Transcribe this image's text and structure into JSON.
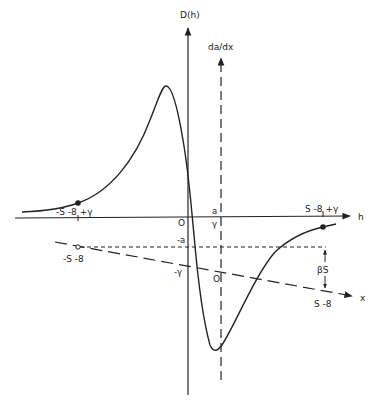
{
  "diagram": {
    "axes": {
      "vertical_main_label": "D(h)",
      "vertical_dashed_label": "da/dx",
      "horizontal_h_label": "h",
      "diagonal_x_label": "x"
    },
    "labels": {
      "left_upper_point": "-S -8 +γ",
      "left_lower_point": "-S -8",
      "origin_main": "O",
      "origin_dashed": "O",
      "a_label": "a",
      "gamma_label": "γ",
      "minus_a_label": "-a",
      "minus_gamma_label": "-γ",
      "right_upper_point": "S -8 +γ",
      "right_lower_point": "S -8",
      "beta_s": "βS"
    },
    "colors": {
      "ink": "#222222",
      "background": "#ffffff"
    }
  }
}
